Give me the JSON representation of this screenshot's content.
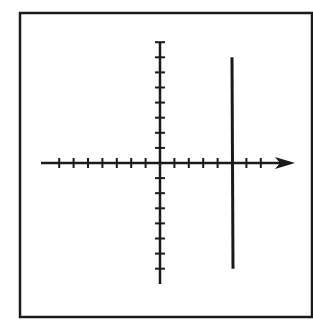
{
  "figure": {
    "frame": {
      "x": 20,
      "y": 13,
      "width": 292,
      "height": 304,
      "stroke": "#1a1a1a"
    },
    "stroke_color": "#1a1a1a",
    "background": "#ffffff"
  },
  "chart_data": {
    "type": "line",
    "title": "",
    "xlabel": "",
    "ylabel": "",
    "xlim": [
      -7,
      8
    ],
    "ylim": [
      -7,
      8
    ],
    "x_tick_count_negative": 7,
    "x_tick_count_positive": 7,
    "y_tick_count_positive": 8,
    "y_tick_count_negative": 7,
    "grid": false,
    "x_axis_arrow": true,
    "series": [
      {
        "name": "x = 5",
        "x": [
          5,
          5
        ],
        "y": [
          7,
          -7
        ]
      }
    ]
  },
  "geometry": {
    "origin_px": [
      160,
      163
    ],
    "unit_px_x": 14.4,
    "unit_px_y": 15.1,
    "x_axis": {
      "x_start": 41,
      "x_end": 282,
      "arrow_tip": 295
    },
    "y_axis": {
      "y_start": 42,
      "y_end": 284
    }
  }
}
